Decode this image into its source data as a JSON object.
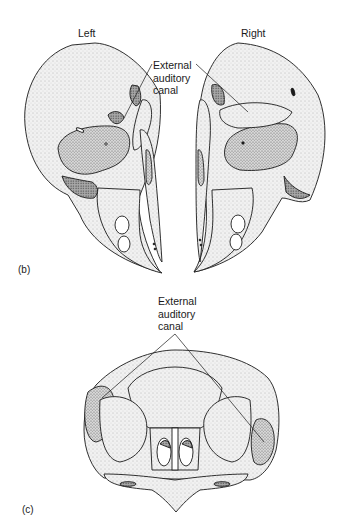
{
  "figure": {
    "panel_b": {
      "label": "(b)",
      "left_view_label": "Left",
      "right_view_label": "Right",
      "callout": {
        "line1": "External",
        "line2": "auditory",
        "line3": "canal"
      }
    },
    "panel_c": {
      "label": "(c)",
      "callout": {
        "line1": "External",
        "line2": "auditory",
        "line3": "canal"
      }
    }
  },
  "colors": {
    "ink": "#1a1a1a",
    "bone_fill": "#e9e9e9",
    "bone_shadow": "#bdbdbd",
    "deep_shadow": "#8a8a8a",
    "background": "#ffffff"
  }
}
